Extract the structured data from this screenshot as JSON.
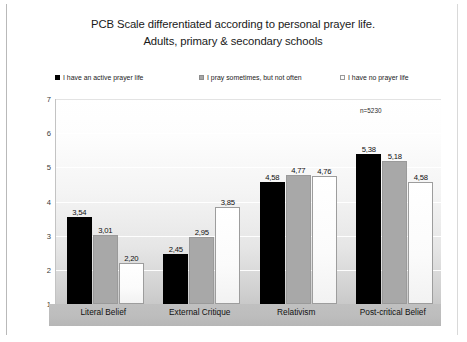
{
  "chart_data": {
    "type": "bar",
    "title": "PCB Scale differentiated according to personal prayer life. Adults, primary & secondary schools",
    "title_lines": [
      "PCB Scale differentiated according to personal prayer life.",
      "Adults, primary & secondary schools"
    ],
    "xlabel": "",
    "ylabel": "",
    "ylim": [
      1,
      7
    ],
    "yticks": [
      "7",
      "6",
      "5",
      "4",
      "3",
      "2",
      "1"
    ],
    "ytick_values": [
      7,
      6,
      5,
      4,
      3,
      2,
      1
    ],
    "grid": true,
    "legend_position": "top",
    "annotation": "n=5230",
    "categories": [
      "Literal Belief",
      "External Critique",
      "Relativism",
      "Post-critical Belief"
    ],
    "series": [
      {
        "name": "I have an active prayer life",
        "color": "#000000",
        "swatch": "sw-black",
        "values": [
          3.54,
          3.01,
          4.58,
          5.38
        ],
        "labels": [
          "3,54",
          "3,01",
          "4,58",
          "5,38"
        ]
      },
      {
        "name": "I pray sometimes, but not often",
        "color": "#a8a8a8",
        "swatch": "sw-gray",
        "values": [
          3.01,
          2.95,
          4.77,
          5.18
        ],
        "labels": [
          "3,01",
          "2,95",
          "4,77",
          "5,18"
        ]
      },
      {
        "name": "I have no prayer life",
        "color": "#fbfbfb",
        "swatch": "sw-white",
        "values": [
          2.2,
          3.85,
          4.76,
          4.58
        ],
        "labels": [
          "2,20",
          "3,85",
          "4,76",
          "4,58"
        ]
      }
    ],
    "series_by_category": [
      {
        "category": "Literal Belief",
        "values": [
          3.54,
          3.01,
          2.2
        ],
        "labels": [
          "3,54",
          "3,01",
          "2,20"
        ]
      },
      {
        "category": "External Critique",
        "values": [
          2.45,
          2.95,
          3.85
        ],
        "labels": [
          "2,45",
          "2,95",
          "3,85"
        ]
      },
      {
        "category": "Relativism",
        "values": [
          4.58,
          4.77,
          4.76
        ],
        "labels": [
          "4,58",
          "4,77",
          "4,76"
        ]
      },
      {
        "category": "Post-critical Belief",
        "values": [
          5.38,
          5.18,
          4.58
        ],
        "labels": [
          "5,38",
          "5,18",
          "4,58"
        ]
      }
    ]
  }
}
